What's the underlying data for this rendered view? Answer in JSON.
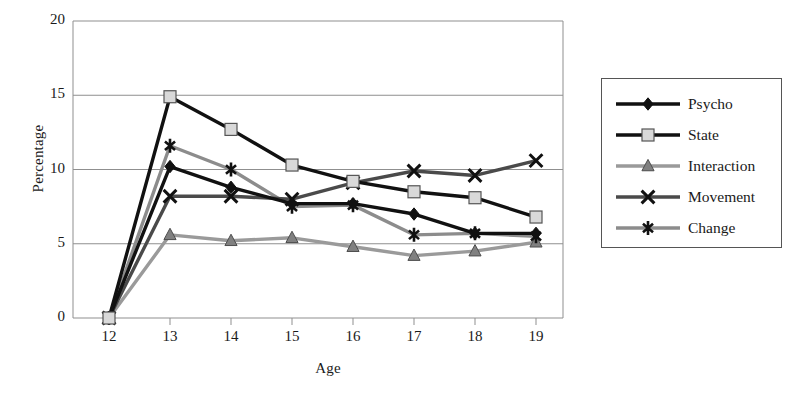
{
  "chart_data": {
    "type": "line",
    "title": "",
    "xlabel": "Age",
    "ylabel": "Percentage",
    "x": [
      12,
      13,
      14,
      15,
      16,
      17,
      18,
      19
    ],
    "xtick_labels": [
      "12",
      "13",
      "14",
      "15",
      "16",
      "17",
      "18",
      "19"
    ],
    "ytick_labels": [
      "0",
      "5",
      "10",
      "15",
      "20"
    ],
    "yticks": [
      0,
      5,
      10,
      15,
      20
    ],
    "xlim": [
      12,
      19
    ],
    "ylim": [
      0,
      20
    ],
    "grid": "horizontal",
    "legend_position": "right-outside",
    "series": [
      {
        "name": "Psycho",
        "marker": "diamond",
        "marker_color": "#111111",
        "line_color": "#111111",
        "values": [
          0,
          10.2,
          8.8,
          7.7,
          7.7,
          7.0,
          5.7,
          5.7
        ]
      },
      {
        "name": "State",
        "marker": "square",
        "marker_color": "#d9d9d9",
        "line_color": "#111111",
        "values": [
          0,
          14.9,
          12.7,
          10.3,
          9.2,
          8.5,
          8.1,
          6.8
        ]
      },
      {
        "name": "Interaction",
        "marker": "triangle",
        "marker_color": "#808080",
        "line_color": "#9a9a9a",
        "values": [
          0,
          5.6,
          5.2,
          5.4,
          4.8,
          4.2,
          4.5,
          5.1
        ]
      },
      {
        "name": "Movement",
        "marker": "x",
        "marker_color": "#111111",
        "line_color": "#4a4a4a",
        "values": [
          0,
          8.2,
          8.2,
          8.0,
          9.1,
          9.9,
          9.6,
          10.6
        ]
      },
      {
        "name": "Change",
        "marker": "asterisk",
        "marker_color": "#111111",
        "line_color": "#8c8c8c",
        "values": [
          0,
          11.6,
          10.0,
          7.5,
          7.6,
          5.6,
          5.7,
          5.5
        ]
      }
    ]
  },
  "legend": {
    "items": [
      {
        "label": "Psycho"
      },
      {
        "label": "State"
      },
      {
        "label": "Interaction"
      },
      {
        "label": "Movement"
      },
      {
        "label": "Change"
      }
    ]
  }
}
